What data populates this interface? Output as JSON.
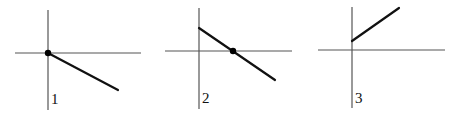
{
  "figure": {
    "panels": [
      {
        "label": "1",
        "description": "Line starting at origin going down to the right (negative slope through origin)",
        "axes": {
          "v": {
            "x": 48,
            "y1": 10,
            "y2": 110
          },
          "h": {
            "y": 53,
            "x1": 15,
            "x2": 141
          }
        },
        "line": {
          "x1": 48,
          "y1": 53,
          "x2": 118,
          "y2": 90
        },
        "dot": {
          "cx": 48,
          "cy": 53
        },
        "label_pos": {
          "x": 51,
          "y": 104
        }
      },
      {
        "label": "2",
        "description": "Line with positive y-intercept and negative slope crossing the x-axis (marked by dot)",
        "axes": {
          "v": {
            "x": 199,
            "y1": 8,
            "y2": 109
          },
          "h": {
            "y": 51,
            "x1": 165,
            "x2": 292
          }
        },
        "line": {
          "x1": 199,
          "y1": 28,
          "x2": 275,
          "y2": 80
        },
        "dot": {
          "cx": 233,
          "cy": 51
        },
        "label_pos": {
          "x": 202,
          "y": 103
        }
      },
      {
        "label": "3",
        "description": "Line with positive y-intercept and positive slope, starting on the y-axis",
        "axes": {
          "v": {
            "x": 352,
            "y1": 7,
            "y2": 108
          },
          "h": {
            "y": 50,
            "x1": 318,
            "x2": 445
          }
        },
        "line": {
          "x1": 352,
          "y1": 41,
          "x2": 399,
          "y2": 8
        },
        "dot": null,
        "label_pos": {
          "x": 355,
          "y": 103
        }
      }
    ]
  }
}
